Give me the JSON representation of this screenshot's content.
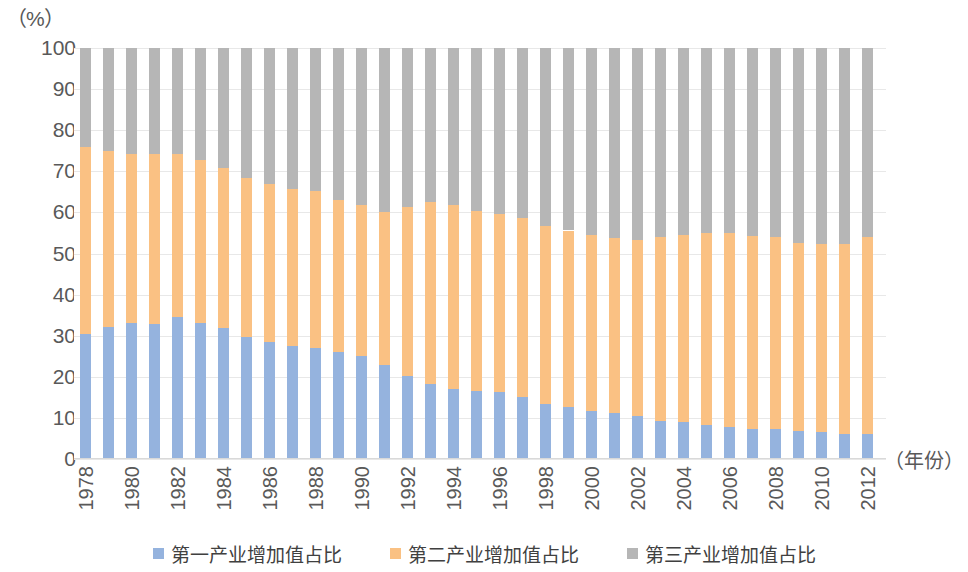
{
  "axes": {
    "y_unit_label": "（%）",
    "x_axis_title": "（年份）",
    "y_ticks": [
      "100",
      "90",
      "80",
      "70",
      "60",
      "50",
      "40",
      "30",
      "20",
      "10",
      "0"
    ],
    "x_ticks": [
      "1978",
      "1980",
      "1982",
      "1984",
      "1986",
      "1988",
      "1990",
      "1992",
      "1994",
      "1996",
      "1998",
      "2000",
      "2002",
      "2004",
      "2006",
      "2008",
      "2010",
      "2012"
    ]
  },
  "legend": {
    "items": [
      {
        "label": "第一产业增加值占比",
        "color": "#95b3de"
      },
      {
        "label": "第二产业增加值占比",
        "color": "#fac183"
      },
      {
        "label": "第三产业增加值占比",
        "color": "#b6b6b6"
      }
    ]
  },
  "colors": {
    "primary": "#95b3de",
    "secondary": "#fac183",
    "tertiary": "#b6b6b6",
    "grid": "#e8e8e8",
    "text": "#595959"
  },
  "chart_data": {
    "type": "bar",
    "stacked": true,
    "title": "",
    "subtitle": "",
    "xlabel": "（年份）",
    "ylabel": "（%）",
    "ylim": [
      0,
      100
    ],
    "ytick_step": 10,
    "grid": true,
    "legend_position": "bottom",
    "categories": [
      "1978",
      "1979",
      "1980",
      "1981",
      "1982",
      "1983",
      "1984",
      "1985",
      "1986",
      "1987",
      "1988",
      "1989",
      "1990",
      "1991",
      "1992",
      "1993",
      "1994",
      "1995",
      "1996",
      "1997",
      "1998",
      "1999",
      "2000",
      "2001",
      "2002",
      "2003",
      "2004",
      "2005",
      "2006",
      "2007",
      "2008",
      "2009",
      "2010",
      "2011",
      "2012"
    ],
    "series": [
      {
        "name": "第一产业增加值占比",
        "color": "#95b3de",
        "values": [
          30.4,
          32.0,
          33.2,
          32.8,
          34.6,
          33.2,
          31.9,
          29.6,
          28.5,
          27.4,
          27.0,
          26.0,
          25.1,
          22.8,
          20.3,
          18.2,
          17.1,
          16.5,
          16.4,
          15.0,
          13.5,
          12.6,
          11.7,
          11.2,
          10.5,
          9.3,
          8.9,
          8.3,
          7.9,
          7.4,
          7.2,
          6.8,
          6.5,
          6.2,
          6.0
        ]
      },
      {
        "name": "第二产业增加值占比",
        "color": "#fac183",
        "values": [
          45.6,
          43.0,
          41.1,
          41.3,
          39.6,
          39.6,
          38.9,
          38.7,
          38.3,
          38.3,
          38.2,
          37.1,
          36.8,
          37.2,
          41.0,
          44.4,
          44.7,
          43.9,
          43.1,
          43.7,
          43.2,
          43.0,
          42.7,
          42.6,
          42.9,
          44.6,
          45.7,
          46.8,
          47.1,
          46.8,
          46.8,
          45.7,
          45.9,
          46.2,
          47.9
        ]
      },
      {
        "name": "第三产业增加值占比",
        "color": "#b6b6b6",
        "values": [
          24.0,
          25.0,
          25.7,
          25.9,
          25.8,
          27.2,
          29.2,
          31.7,
          33.2,
          34.3,
          34.8,
          36.9,
          38.1,
          40.0,
          38.7,
          37.4,
          38.2,
          39.6,
          40.5,
          41.3,
          43.3,
          44.4,
          45.6,
          46.2,
          46.6,
          46.1,
          45.4,
          44.9,
          45.0,
          45.8,
          46.0,
          47.5,
          47.6,
          47.6,
          46.1
        ]
      }
    ]
  }
}
